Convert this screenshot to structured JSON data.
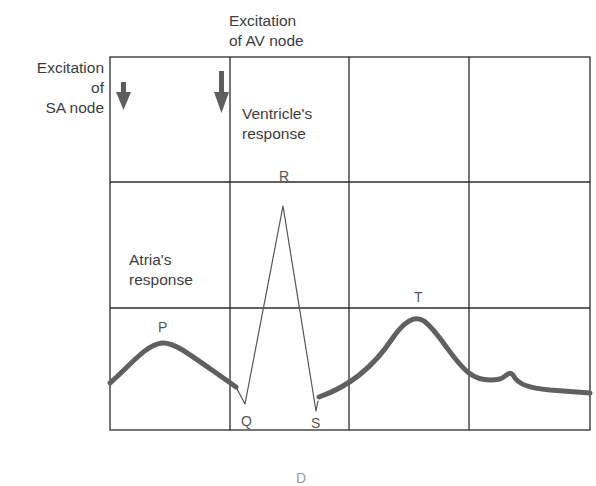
{
  "diagram": {
    "labels": {
      "sa_node": [
        "Excitation",
        "of",
        "SA node"
      ],
      "av_node": [
        "Excitation",
        "of AV node"
      ],
      "ventricle": [
        "Ventricle's",
        "response"
      ],
      "atria": [
        "Atria's",
        "response"
      ]
    },
    "waves": {
      "P": "P",
      "Q": "Q",
      "R": "R",
      "S": "S",
      "T": "T"
    },
    "footer_partial": "D",
    "colors": {
      "grid": "#2b2b2b",
      "trace": "#606060",
      "arrow": "#5e5e5e",
      "text": "#3d3d3d"
    },
    "grid": {
      "columns": 4,
      "rows": 3
    }
  }
}
